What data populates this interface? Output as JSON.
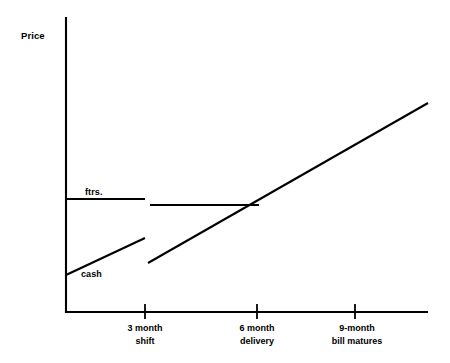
{
  "chart_data": {
    "type": "line",
    "title": "",
    "subtitle": "",
    "ylabel": "Price",
    "xlabel": "",
    "grid": false,
    "legend": "inline-annotations",
    "axis": {
      "x_range_labels": [
        "",
        "3 month shift",
        "6 month delivery",
        "9-month bill matures"
      ],
      "y_ticks": [],
      "x_ticks": [
        {
          "label_line1": "3 month",
          "label_line2": "shift",
          "x": 145
        },
        {
          "label_line1": "6 month",
          "label_line2": "delivery",
          "x": 257
        },
        {
          "label_line1": "9-month",
          "label_line2": "bill matures",
          "x": 355
        }
      ]
    },
    "annotations": [
      {
        "name": "ftrs",
        "text": "ftrs.",
        "x": 85,
        "y": 186
      },
      {
        "name": "cash",
        "text": "cash",
        "x": 81,
        "y": 268
      }
    ],
    "series": [
      {
        "name": "ftrs.",
        "kind": "step-flat",
        "style": "solid",
        "segments": [
          {
            "points": [
              [
                66,
                199
              ],
              [
                145,
                199
              ]
            ]
          },
          {
            "points": [
              [
                150,
                205
              ],
              [
                258,
                205
              ]
            ]
          }
        ]
      },
      {
        "name": "cash",
        "kind": "rising",
        "style": "solid",
        "segments": [
          {
            "points": [
              [
                66,
                275
              ],
              [
                145,
                238
              ]
            ]
          },
          {
            "points": [
              [
                148,
                263
              ],
              [
                428,
                103
              ]
            ]
          }
        ]
      }
    ]
  },
  "labels": {
    "ylabel": "Price",
    "ftrs": "ftrs.",
    "cash": "cash",
    "tick1_line1": "3 month",
    "tick1_line2": "shift",
    "tick2_line1": "6 month",
    "tick2_line2": "delivery",
    "tick3_line1": "9-month",
    "tick3_line2": "bill matures"
  },
  "colors": {
    "ink": "#000000",
    "background": "#ffffff"
  }
}
